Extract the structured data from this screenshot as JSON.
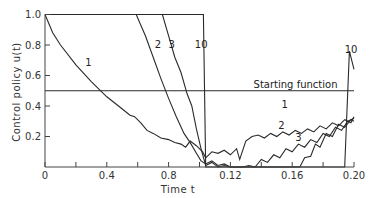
{
  "chart_data": {
    "type": "line",
    "title": "",
    "xlabel": "Time t",
    "ylabel": "Control policy u(t)",
    "xlim": [
      0,
      0.2
    ],
    "ylim": [
      0,
      1.0
    ],
    "x_tick_labels": [
      "0",
      "0.4",
      "0.8",
      "0.12",
      "0.16",
      "0.20"
    ],
    "x_tick_values": [
      0,
      0.04,
      0.08,
      0.12,
      0.16,
      0.2
    ],
    "x_minor_ticks": [
      0.02,
      0.06,
      0.1,
      0.14,
      0.18
    ],
    "y_tick_labels": [
      "0.2",
      "0.4",
      "0.6",
      "0.8",
      "1.0"
    ],
    "y_tick_values": [
      0.2,
      0.4,
      0.6,
      0.8,
      1.0
    ],
    "grid": false,
    "annotations": [
      {
        "text": "Starting function",
        "x": 0.135,
        "y": 0.52
      },
      {
        "text": "1",
        "x": 0.026,
        "y": 0.66,
        "series": "1"
      },
      {
        "text": "2",
        "x": 0.071,
        "y": 0.78,
        "series": "2"
      },
      {
        "text": "3",
        "x": 0.08,
        "y": 0.78,
        "series": "3"
      },
      {
        "text": "10",
        "x": 0.097,
        "y": 0.78,
        "series": "10"
      },
      {
        "text": "1",
        "x": 0.153,
        "y": 0.39,
        "series": "1"
      },
      {
        "text": "2",
        "x": 0.151,
        "y": 0.25,
        "series": "2"
      },
      {
        "text": "3",
        "x": 0.162,
        "y": 0.17,
        "series": "3"
      },
      {
        "text": "10",
        "x": 0.194,
        "y": 0.75,
        "series": "10"
      }
    ],
    "series": [
      {
        "name": "Starting function",
        "x": [
          0,
          0.2
        ],
        "y": [
          0.5,
          0.5
        ]
      },
      {
        "name": "1",
        "x": [
          0,
          0.005,
          0.01,
          0.02,
          0.03,
          0.04,
          0.05,
          0.055,
          0.058,
          0.062,
          0.066,
          0.07,
          0.075,
          0.08,
          0.084,
          0.088,
          0.091,
          0.094,
          0.098,
          0.102,
          0.104,
          0.108,
          0.112,
          0.116,
          0.12,
          0.124,
          0.126,
          0.13,
          0.134,
          0.138,
          0.142,
          0.146,
          0.15,
          0.154,
          0.158,
          0.162,
          0.166,
          0.17,
          0.174,
          0.178,
          0.182,
          0.186,
          0.19,
          0.194,
          0.198,
          0.2
        ],
        "y": [
          1.0,
          0.88,
          0.8,
          0.67,
          0.56,
          0.46,
          0.38,
          0.34,
          0.33,
          0.29,
          0.24,
          0.22,
          0.19,
          0.18,
          0.16,
          0.15,
          0.13,
          0.17,
          0.14,
          0.1,
          0.06,
          0.1,
          0.09,
          0.11,
          0.08,
          0.12,
          0.05,
          0.17,
          0.2,
          0.21,
          0.19,
          0.22,
          0.2,
          0.23,
          0.21,
          0.24,
          0.22,
          0.25,
          0.23,
          0.27,
          0.25,
          0.29,
          0.27,
          0.31,
          0.29,
          0.33
        ]
      },
      {
        "name": "2",
        "x": [
          0,
          0.059,
          0.065,
          0.07,
          0.075,
          0.08,
          0.085,
          0.09,
          0.094,
          0.098,
          0.101,
          0.104,
          0.108,
          0.112,
          0.116,
          0.12,
          0.124,
          0.128,
          0.132,
          0.136,
          0.14,
          0.144,
          0.148,
          0.152,
          0.156,
          0.16,
          0.164,
          0.168,
          0.172,
          0.176,
          0.18,
          0.184,
          0.188,
          0.192,
          0.196,
          0.2
        ],
        "y": [
          1.0,
          1.0,
          0.86,
          0.72,
          0.58,
          0.45,
          0.33,
          0.22,
          0.16,
          0.09,
          0.04,
          0.02,
          0.04,
          0.01,
          0.02,
          0.0,
          0.0,
          0.0,
          0.01,
          0.0,
          0.05,
          0.03,
          0.08,
          0.06,
          0.12,
          0.1,
          0.15,
          0.13,
          0.18,
          0.16,
          0.22,
          0.2,
          0.26,
          0.24,
          0.3,
          0.32
        ]
      },
      {
        "name": "3",
        "x": [
          0,
          0.076,
          0.08,
          0.084,
          0.088,
          0.092,
          0.095,
          0.098,
          0.101,
          0.104,
          0.108,
          0.112,
          0.116,
          0.12,
          0.13,
          0.14,
          0.15,
          0.16,
          0.165,
          0.168,
          0.172,
          0.175,
          0.178,
          0.182,
          0.186,
          0.19,
          0.194,
          0.198,
          0.2
        ],
        "y": [
          1.0,
          1.0,
          0.86,
          0.72,
          0.62,
          0.48,
          0.4,
          0.25,
          0.12,
          0.01,
          0.03,
          0.0,
          0.01,
          0.0,
          0.0,
          0.0,
          0.0,
          0.0,
          0.0,
          0.06,
          0.07,
          0.15,
          0.13,
          0.22,
          0.2,
          0.28,
          0.26,
          0.31,
          0.3
        ]
      },
      {
        "name": "10",
        "x": [
          0,
          0.1025,
          0.104,
          0.19,
          0.194,
          0.197,
          0.2
        ],
        "y": [
          1.0,
          1.0,
          0.0,
          0.0,
          0.0,
          0.76,
          0.64
        ]
      }
    ]
  },
  "axes": {
    "xlabel": "Time t",
    "ylabel": "Control policy u(t)"
  }
}
